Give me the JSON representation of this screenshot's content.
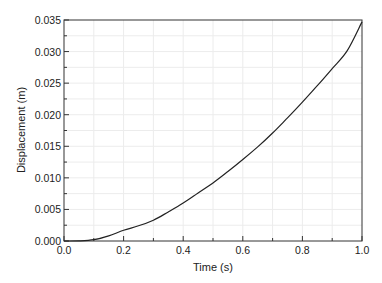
{
  "chart_data": {
    "type": "line",
    "title": "",
    "xlabel": "Time (s)",
    "ylabel": "Displacement (m)",
    "xlim": [
      0.0,
      1.0
    ],
    "ylim": [
      0.0,
      0.035
    ],
    "grid": true,
    "legend": null,
    "x_ticks": [
      "0.0",
      "0.2",
      "0.4",
      "0.6",
      "0.8",
      "1.0"
    ],
    "y_ticks": [
      "0.000",
      "0.005",
      "0.010",
      "0.015",
      "0.020",
      "0.025",
      "0.030",
      "0.035"
    ],
    "series": [
      {
        "name": "Displacement",
        "color": "#222222",
        "x": [
          0.0,
          0.05,
          0.1,
          0.15,
          0.2,
          0.25,
          0.3,
          0.35,
          0.4,
          0.45,
          0.5,
          0.55,
          0.6,
          0.65,
          0.7,
          0.75,
          0.8,
          0.85,
          0.9,
          0.95,
          1.0
        ],
        "y": [
          0.0,
          2e-05,
          0.0002,
          0.0008,
          0.0017,
          0.0024,
          0.0033,
          0.0046,
          0.006,
          0.0076,
          0.0092,
          0.011,
          0.0129,
          0.0149,
          0.0171,
          0.0195,
          0.022,
          0.0246,
          0.0273,
          0.0301,
          0.0347
        ]
      }
    ]
  }
}
